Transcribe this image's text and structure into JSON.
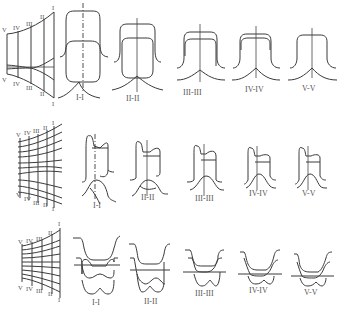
{
  "figure": {
    "rows": [
      {
        "name": "row-1",
        "grid_labels_top": [
          "V",
          "IV",
          "III",
          "II",
          "I"
        ],
        "grid_labels_bottom": [
          "V",
          "IV",
          "III",
          "II",
          "I"
        ],
        "sections": [
          "I-I",
          "II-II",
          "III-III",
          "IV-IV",
          "V-V"
        ]
      },
      {
        "name": "row-2",
        "grid_labels_top": [
          "V",
          "IV",
          "III",
          "II",
          "I"
        ],
        "grid_labels_bottom": [
          "V",
          "IV",
          "III",
          "II",
          "I"
        ],
        "sections": [
          "I-I",
          "II-II",
          "III-III",
          "IV-IV",
          "V-V"
        ]
      },
      {
        "name": "row-3",
        "grid_labels_top": [
          "V",
          "IV",
          "III",
          "II",
          "I"
        ],
        "grid_labels_bottom": [
          "V",
          "IV",
          "III",
          "II",
          "I"
        ],
        "sections": [
          "I-I",
          "II-II",
          "III-III",
          "IV-IV",
          "V-V"
        ]
      }
    ],
    "colors": {
      "line": "#3a3a3a",
      "text": "#555555",
      "background": "#ffffff"
    }
  }
}
